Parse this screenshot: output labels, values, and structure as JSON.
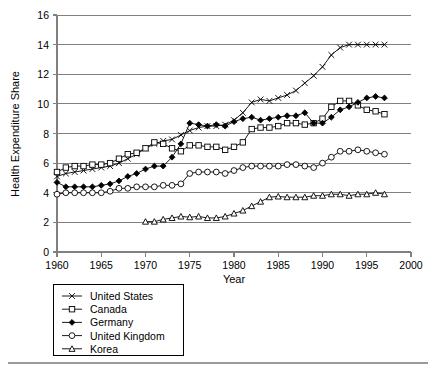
{
  "chart_data": {
    "type": "line",
    "title": "",
    "xlabel": "Year",
    "ylabel": "Health Expenditure Share",
    "xlim": [
      1960,
      2000
    ],
    "ylim": [
      0,
      16
    ],
    "xticks": [
      1960,
      1965,
      1970,
      1975,
      1980,
      1985,
      1990,
      1995,
      2000
    ],
    "yticks": [
      0,
      2,
      4,
      6,
      8,
      10,
      12,
      14,
      16
    ],
    "grid": "horizontal",
    "legend_position": "below-left",
    "series": [
      {
        "name": "United States",
        "marker": "x",
        "x": [
          1960,
          1961,
          1962,
          1963,
          1964,
          1965,
          1966,
          1967,
          1968,
          1969,
          1970,
          1971,
          1972,
          1973,
          1974,
          1975,
          1976,
          1977,
          1978,
          1979,
          1980,
          1981,
          1982,
          1983,
          1984,
          1985,
          1986,
          1987,
          1988,
          1989,
          1990,
          1991,
          1992,
          1993,
          1994,
          1995,
          1996,
          1997
        ],
        "values": [
          5.1,
          5.3,
          5.4,
          5.5,
          5.6,
          5.7,
          5.8,
          6.0,
          6.3,
          6.6,
          7.0,
          7.3,
          7.5,
          7.6,
          7.9,
          8.2,
          8.4,
          8.5,
          8.5,
          8.6,
          8.9,
          9.4,
          10.1,
          10.3,
          10.2,
          10.4,
          10.6,
          10.9,
          11.4,
          11.9,
          12.5,
          13.3,
          13.8,
          14.0,
          14.0,
          14.0,
          14.0,
          14.0
        ]
      },
      {
        "name": "Canada",
        "marker": "open-square",
        "x": [
          1960,
          1961,
          1962,
          1963,
          1964,
          1965,
          1966,
          1967,
          1968,
          1969,
          1970,
          1971,
          1972,
          1973,
          1974,
          1975,
          1976,
          1977,
          1978,
          1979,
          1980,
          1981,
          1982,
          1983,
          1984,
          1985,
          1986,
          1987,
          1988,
          1989,
          1990,
          1991,
          1992,
          1993,
          1994,
          1995,
          1996,
          1997
        ],
        "values": [
          5.4,
          5.7,
          5.8,
          5.8,
          5.9,
          5.9,
          6.0,
          6.3,
          6.6,
          6.7,
          7.0,
          7.4,
          7.3,
          7.0,
          6.8,
          7.2,
          7.2,
          7.1,
          7.1,
          6.9,
          7.1,
          7.4,
          8.3,
          8.4,
          8.4,
          8.5,
          8.7,
          8.7,
          8.6,
          8.7,
          9.0,
          9.8,
          10.2,
          10.2,
          9.9,
          9.6,
          9.5,
          9.3
        ]
      },
      {
        "name": "Germany",
        "marker": "filled-diamond",
        "x": [
          1960,
          1961,
          1962,
          1963,
          1964,
          1965,
          1966,
          1967,
          1968,
          1969,
          1970,
          1971,
          1972,
          1973,
          1974,
          1975,
          1976,
          1977,
          1978,
          1979,
          1980,
          1981,
          1982,
          1983,
          1984,
          1985,
          1986,
          1987,
          1988,
          1989,
          1990,
          1991,
          1992,
          1993,
          1994,
          1995,
          1996,
          1997
        ],
        "values": [
          4.7,
          4.4,
          4.4,
          4.4,
          4.4,
          4.5,
          4.6,
          4.8,
          5.1,
          5.3,
          5.6,
          5.8,
          5.8,
          6.4,
          7.3,
          8.7,
          8.6,
          8.5,
          8.6,
          8.5,
          8.8,
          9.0,
          9.1,
          8.9,
          9.0,
          9.1,
          9.2,
          9.2,
          9.4,
          8.7,
          8.7,
          9.1,
          9.6,
          9.8,
          10.1,
          10.4,
          10.5,
          10.4
        ]
      },
      {
        "name": "United Kingdom",
        "marker": "open-circle",
        "x": [
          1960,
          1961,
          1962,
          1963,
          1964,
          1965,
          1966,
          1967,
          1968,
          1969,
          1970,
          1971,
          1972,
          1973,
          1974,
          1975,
          1976,
          1977,
          1978,
          1979,
          1980,
          1981,
          1982,
          1983,
          1984,
          1985,
          1986,
          1987,
          1988,
          1989,
          1990,
          1991,
          1992,
          1993,
          1994,
          1995,
          1996,
          1997
        ],
        "values": [
          3.9,
          4.0,
          4.0,
          4.0,
          4.0,
          4.0,
          4.1,
          4.3,
          4.3,
          4.4,
          4.4,
          4.4,
          4.5,
          4.5,
          4.6,
          5.3,
          5.4,
          5.4,
          5.4,
          5.3,
          5.5,
          5.7,
          5.8,
          5.8,
          5.8,
          5.8,
          5.9,
          5.9,
          5.8,
          5.7,
          6.0,
          6.4,
          6.8,
          6.8,
          6.9,
          6.8,
          6.7,
          6.6
        ]
      },
      {
        "name": "Korea",
        "marker": "open-triangle",
        "x": [
          1970,
          1971,
          1972,
          1973,
          1974,
          1975,
          1976,
          1977,
          1978,
          1979,
          1980,
          1981,
          1982,
          1983,
          1984,
          1985,
          1986,
          1987,
          1988,
          1989,
          1990,
          1991,
          1992,
          1993,
          1994,
          1995,
          1996,
          1997
        ],
        "values": [
          2.05,
          2.05,
          2.2,
          2.3,
          2.4,
          2.35,
          2.4,
          2.3,
          2.3,
          2.4,
          2.6,
          2.8,
          3.1,
          3.4,
          3.7,
          3.75,
          3.7,
          3.7,
          3.7,
          3.8,
          3.8,
          3.9,
          3.9,
          3.8,
          3.9,
          3.9,
          4.0,
          3.9
        ]
      }
    ]
  },
  "legend": {
    "entries": [
      {
        "label": "United States",
        "marker": "x"
      },
      {
        "label": "Canada",
        "marker": "open-square"
      },
      {
        "label": "Germany",
        "marker": "filled-diamond"
      },
      {
        "label": "United Kingdom",
        "marker": "open-circle"
      },
      {
        "label": "Korea",
        "marker": "open-triangle"
      }
    ]
  },
  "colors": {
    "series": "#000000",
    "grid": "#808080",
    "axis": "#808080",
    "background": "#ffffff"
  }
}
